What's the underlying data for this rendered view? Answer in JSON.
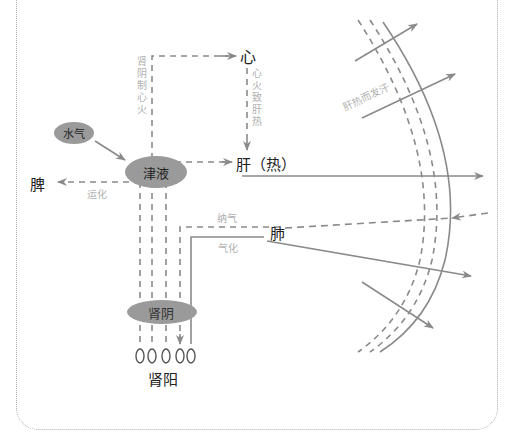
{
  "title_partial": "",
  "nodes": {
    "heart": "心",
    "liver": "肝（热）",
    "spleen": "脾",
    "lung": "肺",
    "jinye": "津液",
    "shuiqi": "水气",
    "shenyin": "肾阴",
    "shenyang": "肾阳",
    "shenyang_circles": "OOOOO"
  },
  "edge_labels": {
    "shenyin_zhi_xinhuo": "肾阴制心火",
    "xinhuo_zhi_ganre": "心火致肝热",
    "yunhua": "运化",
    "naqi": "纳气",
    "qihua": "气化",
    "ganre_er_fahan": "肝热而发汗"
  },
  "colors": {
    "line": "#8a8a8a",
    "ellipse": "#9a9a9a",
    "label_faint": "#b0b0b0",
    "text": "#222222",
    "frame": "#aaaaaa"
  }
}
